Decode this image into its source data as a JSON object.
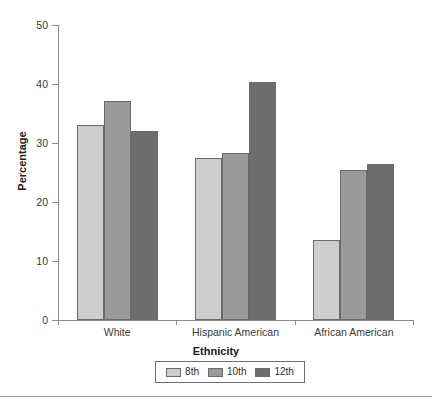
{
  "chart_data": {
    "type": "bar",
    "title": "",
    "xlabel": "Ethnicity",
    "ylabel": "Percentage",
    "categories": [
      "White",
      "Hispanic American",
      "African American"
    ],
    "series": [
      {
        "name": "8th",
        "values": [
          33.0,
          27.4,
          13.6
        ],
        "color": "#cdcdcd"
      },
      {
        "name": "10th",
        "values": [
          37.2,
          28.3,
          25.4
        ],
        "color": "#9a9a9a"
      },
      {
        "name": "12th",
        "values": [
          32.1,
          40.3,
          26.4
        ],
        "color": "#6e6e6e"
      }
    ],
    "ylim": [
      0,
      50
    ],
    "yticks": [
      0,
      10,
      20,
      30,
      40,
      50
    ],
    "ytick_labels": [
      "0",
      "10",
      "20",
      "30",
      "40",
      "50"
    ],
    "grid": false,
    "legend_position": "bottom-center"
  },
  "axes": {
    "y_title": "Percentage",
    "x_title": "Ethnicity"
  },
  "legend": {
    "items": [
      {
        "label": "8th",
        "color": "#cdcdcd"
      },
      {
        "label": "10th",
        "color": "#9a9a9a"
      },
      {
        "label": "12th",
        "color": "#6e6e6e"
      }
    ]
  },
  "ticks": {
    "y": [
      "0",
      "10",
      "20",
      "30",
      "40",
      "50"
    ],
    "x": [
      "White",
      "Hispanic American",
      "African American"
    ]
  }
}
